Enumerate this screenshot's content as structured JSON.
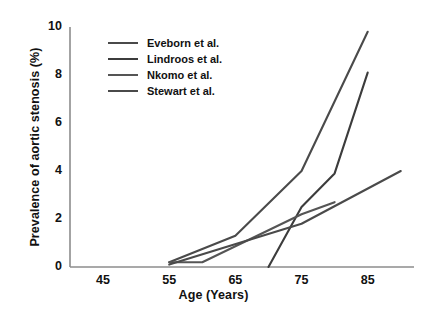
{
  "chart_data": {
    "type": "line",
    "title": "",
    "xlabel": "Age (Years)",
    "ylabel": "Prevalence of aortic stenosis (%)",
    "xlim": [
      40,
      92
    ],
    "ylim": [
      0,
      10
    ],
    "xticks": [
      45,
      55,
      65,
      75,
      85
    ],
    "yticks": [
      0,
      2,
      4,
      6,
      8,
      10
    ],
    "xtick_labels": [
      "45",
      "55",
      "65",
      "75",
      "85"
    ],
    "ytick_labels": [
      "0",
      "2",
      "4",
      "6",
      "8",
      "10"
    ],
    "grid": false,
    "legend_position": "upper-left",
    "series": [
      {
        "name": "Eveborn et al.",
        "color": "#4a4a4a",
        "x": [
          55,
          65,
          75,
          85
        ],
        "values": [
          0.2,
          1.3,
          4.0,
          9.8
        ]
      },
      {
        "name": "Lindroos et al.",
        "color": "#3c3c3c",
        "x": [
          70,
          75,
          80,
          85
        ],
        "values": [
          0.0,
          2.5,
          3.9,
          8.1
        ]
      },
      {
        "name": "Nkomo et al.",
        "color": "#555555",
        "x": [
          55,
          60,
          75,
          80
        ],
        "values": [
          0.2,
          0.2,
          2.2,
          2.7
        ]
      },
      {
        "name": "Stewart et al.",
        "color": "#4a4a4a",
        "x": [
          55,
          75,
          90
        ],
        "values": [
          0.1,
          1.8,
          4.0
        ]
      }
    ]
  },
  "legend": {
    "entries": [
      {
        "label": "Eveborn et al."
      },
      {
        "label": "Lindroos et al."
      },
      {
        "label": "Nkomo et al."
      },
      {
        "label": "Stewart et al."
      }
    ]
  },
  "axes": {
    "x_title": "Age (Years)",
    "y_title": "Prevalence of aortic stenosis (%)"
  },
  "colors": {
    "axis": "#8c8c8c",
    "text": "#111111",
    "line_default": "#4a4a4a",
    "background": "#ffffff"
  }
}
